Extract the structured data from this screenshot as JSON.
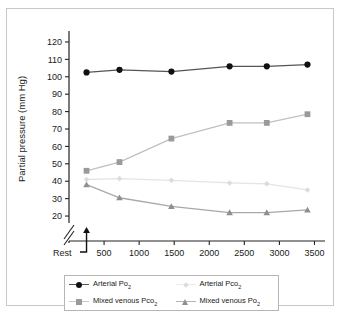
{
  "figure": {
    "frame_border_color": "#c8c8c8"
  },
  "chart_data": {
    "type": "line",
    "title": "",
    "xlabel": "Oxygen consumption (mL/min⁻¹)",
    "ylabel": "Partial pressure (mm Hg)",
    "xlim": [
      0,
      3650
    ],
    "ylim": [
      16,
      124
    ],
    "grid": false,
    "axis_break": true,
    "axis_break_note": "y-axis broken between 0 and 20",
    "legend_position": "below-center",
    "xticks": [
      500,
      1000,
      1500,
      2000,
      2500,
      3000,
      3500
    ],
    "xtick_labels": [
      "500",
      "1000",
      "1500",
      "2000",
      "2500",
      "3000",
      "3500"
    ],
    "rest_label": "Rest",
    "rest_x": 250,
    "yticks": [
      20,
      30,
      40,
      50,
      60,
      70,
      80,
      90,
      100,
      110,
      120
    ],
    "ytick_labels": [
      "20",
      "30",
      "40",
      "50",
      "60",
      "70",
      "80",
      "90",
      "100",
      "110",
      "120"
    ],
    "x": [
      250,
      720,
      1460,
      2290,
      2820,
      3400
    ],
    "series": [
      {
        "name": "Arterial Po2",
        "legend_label": "Arterial Po",
        "legend_sub": "2",
        "marker": "circle",
        "color": "#111111",
        "line_color": "#555555",
        "values": [
          102.5,
          104,
          103,
          106,
          106,
          107
        ]
      },
      {
        "name": "Mixed venous Pco2",
        "legend_label": "Mixed venous Pco",
        "legend_sub": "2",
        "marker": "square",
        "color": "#9a9a9a",
        "line_color": "#c0c0c0",
        "values": [
          46,
          51,
          64.5,
          73.5,
          73.5,
          78.5
        ]
      },
      {
        "name": "Arterial Pco2",
        "legend_label": "Arterial Pco",
        "legend_sub": "2",
        "marker": "diamond",
        "color": "#dcdcdc",
        "line_color": "#e4e4e4",
        "values": [
          41,
          41.5,
          40.5,
          39,
          38.5,
          35
        ]
      },
      {
        "name": "Mixed venous Po2",
        "legend_label": "Mixed venous Po",
        "legend_sub": "2",
        "marker": "triangle",
        "color": "#8f8f8f",
        "line_color": "#a8a8a8",
        "values": [
          38,
          30.5,
          25.5,
          22,
          22,
          23.5
        ]
      }
    ]
  }
}
